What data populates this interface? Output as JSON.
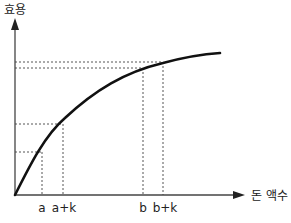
{
  "diagram": {
    "type": "utility-curve",
    "y_axis_label": "효용",
    "x_axis_label": "돈 액수",
    "x_ticks": [
      {
        "label": "a",
        "x": 42
      },
      {
        "label": "a+k",
        "x": 63
      },
      {
        "label": "b",
        "x": 143
      },
      {
        "label": "b+k",
        "x": 163
      }
    ],
    "colors": {
      "curve": "#111111",
      "axis": "#444444",
      "guide": "#555555"
    }
  }
}
